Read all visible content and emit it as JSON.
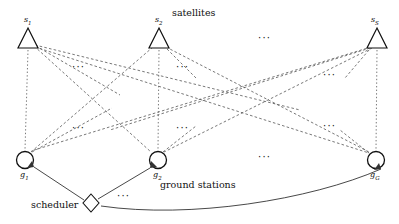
{
  "figure": {
    "group_labels": {
      "satellites": "satellites",
      "ground_stations": "ground stations",
      "scheduler": "scheduler"
    },
    "satellites": [
      {
        "id": "s1",
        "base": "s",
        "sub": "1",
        "x": 28,
        "y": 40
      },
      {
        "id": "s2",
        "base": "s",
        "sub": "2",
        "x": 159,
        "y": 40
      },
      {
        "id": "sS",
        "base": "s",
        "sub": "S",
        "x": 377,
        "y": 40
      }
    ],
    "ground_stations": [
      {
        "id": "g1",
        "base": "g",
        "sub": "1",
        "x": 23,
        "y": 160
      },
      {
        "id": "g2",
        "base": "g",
        "sub": "2",
        "x": 157,
        "y": 160
      },
      {
        "id": "gG",
        "base": "g",
        "sub": "G",
        "x": 375,
        "y": 160
      }
    ],
    "scheduler_node": {
      "id": "scheduler",
      "x": 91,
      "y": 203
    },
    "ellipses": [
      {
        "name": "satellites-row-ellipsis",
        "x": 258,
        "y": 38,
        "text": "···"
      },
      {
        "name": "upper-left-ellipsis",
        "x": 72,
        "y": 67,
        "text": "···"
      },
      {
        "name": "upper-right-inner-ellipsis",
        "x": 176,
        "y": 67,
        "text": "···"
      },
      {
        "name": "upper-far-right-ellipsis",
        "x": 323,
        "y": 75,
        "text": "···"
      },
      {
        "name": "lower-left-ellipsis",
        "x": 72,
        "y": 128,
        "text": "···"
      },
      {
        "name": "lower-mid-ellipsis",
        "x": 176,
        "y": 128,
        "text": "···"
      },
      {
        "name": "lower-far-right-ellipsis",
        "x": 323,
        "y": 126,
        "text": "···"
      },
      {
        "name": "ground-row-ellipsis",
        "x": 258,
        "y": 157,
        "text": "···"
      },
      {
        "name": "scheduler-row-ellipsis",
        "x": 117,
        "y": 196,
        "text": "···"
      }
    ],
    "colors": {
      "stroke": "#1a1a1a",
      "dashed": "#555555",
      "background": "#ffffff"
    }
  }
}
